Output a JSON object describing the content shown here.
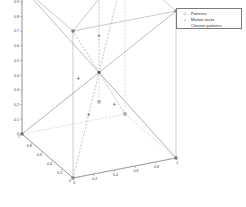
{
  "figure": {
    "background_color": "#ffffff",
    "axis_color": "#7a7a7a",
    "solid_edge_color": "#8a8a8a",
    "dashed_edge_color": "#a8a8a8",
    "marker_color": "#444444",
    "tick_label_color": "#3a3a3a"
  },
  "legend": {
    "border_color": "#7a7a7a",
    "entries": [
      {
        "marker": "square-marker",
        "glyph": "□",
        "label": "Patterns"
      },
      {
        "marker": "plus-marker",
        "glyph": "+",
        "label": "Motion tasks"
      },
      {
        "marker": "dot-marker",
        "glyph": "·",
        "label": "Chosen patterns"
      }
    ]
  },
  "chart_data": {
    "type": "scatter",
    "title": "",
    "xlabel": "",
    "ylabel": "",
    "zlabel": "",
    "projection": "3d",
    "grid": false,
    "legend_position": "top-right",
    "xlim": [
      0,
      1
    ],
    "ylim": [
      0,
      1
    ],
    "zlim": [
      0,
      1
    ],
    "x_ticks": [
      0,
      0.2,
      0.4,
      0.6,
      0.8,
      1
    ],
    "x_tick_labels": [
      "0",
      "0.2",
      "0.4",
      "0.6",
      "0.8",
      "1"
    ],
    "y_ticks": [
      0,
      0.2,
      0.4,
      0.6,
      0.8,
      1
    ],
    "y_tick_labels": [
      "0",
      "0.2",
      "0.4",
      "0.6",
      "0.8",
      "1"
    ],
    "z_ticks": [
      0,
      0.1,
      0.2,
      0.3,
      0.4,
      0.5,
      0.6,
      0.7,
      0.8,
      0.9,
      1
    ],
    "z_tick_labels": [
      "0",
      "0.1",
      "0.2",
      "0.3",
      "0.4",
      "0.5",
      "0.6",
      "0.7",
      "0.8",
      "0.9",
      "1"
    ],
    "series": [
      {
        "name": "Patterns",
        "marker": "square",
        "points": [
          [
            0,
            0,
            0
          ],
          [
            1,
            0,
            0
          ],
          [
            0,
            1,
            0
          ],
          [
            1,
            1,
            0
          ],
          [
            0,
            0,
            1
          ],
          [
            1,
            0,
            1
          ],
          [
            0,
            1,
            1
          ],
          [
            1,
            1,
            1
          ],
          [
            0.5,
            0.5,
            0.5
          ],
          [
            0.5,
            0.5,
            0.3
          ]
        ]
      },
      {
        "name": "Motion tasks",
        "marker": "plus",
        "points": [
          [
            0.5,
            0.5,
            0.5
          ],
          [
            0.35,
            0.6,
            0.45
          ],
          [
            0.6,
            0.4,
            0.3
          ],
          [
            0.5,
            0.5,
            0.75
          ],
          [
            0.3,
            0.3,
            0.3
          ]
        ]
      },
      {
        "name": "Chosen patterns",
        "marker": "dot",
        "points": [
          [
            0,
            0,
            1
          ],
          [
            1,
            1,
            1
          ],
          [
            1,
            0,
            0
          ],
          [
            0,
            1,
            0
          ],
          [
            0.5,
            0.5,
            0.5
          ]
        ]
      }
    ],
    "edges_solid": [
      [
        0,
        0,
        1,
        1,
        0,
        1
      ],
      [
        0,
        1,
        1,
        1,
        1,
        1
      ],
      [
        0,
        0,
        1,
        0,
        1,
        1
      ],
      [
        0,
        0,
        0,
        0,
        0,
        1
      ],
      [
        0,
        0,
        0,
        1,
        0,
        0
      ],
      [
        0,
        0,
        0,
        0,
        1,
        0
      ],
      [
        1,
        0,
        0,
        1,
        0,
        1
      ],
      [
        0,
        1,
        0,
        0,
        1,
        1
      ],
      [
        0,
        0,
        1,
        1,
        1,
        1
      ],
      [
        1,
        0,
        1,
        1,
        1,
        1
      ],
      [
        1,
        0,
        0,
        0,
        1,
        1
      ],
      [
        0,
        1,
        0,
        1,
        0,
        1
      ]
    ],
    "edges_dashed": [
      [
        1,
        1,
        0,
        1,
        1,
        1
      ],
      [
        1,
        1,
        0,
        1,
        0,
        0
      ],
      [
        1,
        1,
        0,
        0,
        1,
        0
      ],
      [
        0,
        0,
        0,
        1,
        1,
        1
      ],
      [
        0,
        0,
        1,
        1,
        1,
        0
      ],
      [
        0,
        1,
        1,
        1,
        0,
        0
      ],
      [
        1,
        0,
        1,
        0,
        1,
        0
      ],
      [
        0,
        0,
        1,
        0.5,
        0.5,
        0.5
      ],
      [
        1,
        1,
        1,
        0.5,
        0.5,
        0.5
      ],
      [
        0,
        1,
        0,
        0.5,
        0.5,
        0.5
      ],
      [
        1,
        0,
        0,
        0.5,
        0.5,
        0.5
      ],
      [
        0,
        0,
        0,
        0.5,
        0.5,
        0.5
      ],
      [
        1,
        1,
        0,
        0.5,
        0.5,
        0.5
      ],
      [
        0.5,
        0.5,
        0.5,
        0.5,
        0.5,
        1
      ],
      [
        0.5,
        0.5,
        0.3,
        0.5,
        0.5,
        1
      ]
    ]
  }
}
